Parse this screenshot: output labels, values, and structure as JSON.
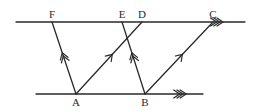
{
  "diagram": {
    "colors": {
      "stroke": "#2a2a2a",
      "background": "#ffffff"
    },
    "points": {
      "F": {
        "label": "F",
        "x": 52,
        "y": 22,
        "label_pos": "above"
      },
      "E": {
        "label": "E",
        "x": 122,
        "y": 22,
        "label_pos": "above"
      },
      "D": {
        "label": "D",
        "x": 142,
        "y": 22,
        "label_pos": "above"
      },
      "C": {
        "label": "C",
        "x": 213,
        "y": 22,
        "label_pos": "above"
      },
      "A": {
        "label": "A",
        "x": 76,
        "y": 94,
        "label_pos": "below"
      },
      "B": {
        "label": "B",
        "x": 145,
        "y": 94,
        "label_pos": "below"
      }
    },
    "parallel_lines": [
      {
        "name": "top-line",
        "x1": 16,
        "y1": 22,
        "x2": 245,
        "y2": 22,
        "marker": "triple-chevron",
        "marker_at": 0.89
      },
      {
        "name": "bottom-line",
        "x1": 36,
        "y1": 94,
        "x2": 203,
        "y2": 94,
        "marker": "triple-chevron",
        "marker_at": 0.88
      }
    ],
    "segments": [
      {
        "name": "segment-AF",
        "from": "A",
        "to": "F",
        "marker": "double-chevron",
        "marker_at": 0.55
      },
      {
        "name": "segment-AD",
        "from": "A",
        "to": "D",
        "marker": "single-chevron",
        "marker_at": 0.55
      },
      {
        "name": "segment-BE",
        "from": "B",
        "to": "E",
        "marker": "double-chevron",
        "marker_at": 0.55
      },
      {
        "name": "segment-BC",
        "from": "B",
        "to": "C",
        "marker": "single-chevron",
        "marker_at": 0.55
      }
    ],
    "labels": {
      "F": "F",
      "E": "E",
      "D": "D",
      "C": "C",
      "A": "A",
      "B": "B"
    }
  }
}
